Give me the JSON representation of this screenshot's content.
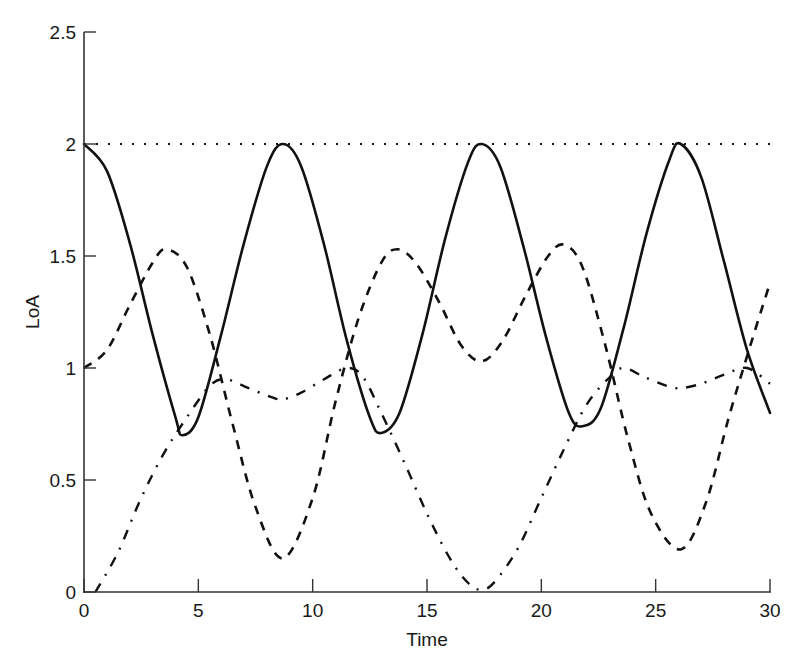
{
  "chart_data": {
    "type": "line",
    "title": "",
    "xlabel": "Time",
    "ylabel": "LoA",
    "xlim": [
      0,
      30
    ],
    "ylim": [
      0,
      2.5
    ],
    "xticks": [
      0,
      5,
      10,
      15,
      20,
      25,
      30
    ],
    "xtick_labels": [
      "0",
      "5",
      "10",
      "15",
      "20",
      "25",
      "30"
    ],
    "yticks": [
      0,
      0.5,
      1,
      1.5,
      2,
      2.5
    ],
    "ytick_labels": [
      "0",
      "0.5",
      "1",
      "1.5",
      "2",
      "2.5"
    ],
    "grid": false,
    "legend": null,
    "series": [
      {
        "name": "solid",
        "style": "solid",
        "color": "#111111",
        "x": [
          0,
          1,
          2,
          3,
          4,
          4.3,
          5,
          6,
          7,
          8,
          8.7,
          9.5,
          10.5,
          11.5,
          12.5,
          13.0,
          13.8,
          14.8,
          15.8,
          16.8,
          17.4,
          18.2,
          19.2,
          20.2,
          21.2,
          21.8,
          22.6,
          23.6,
          24.6,
          25.6,
          26.1,
          27,
          28,
          29,
          30
        ],
        "y": [
          2.0,
          1.88,
          1.56,
          1.15,
          0.78,
          0.7,
          0.78,
          1.15,
          1.56,
          1.9,
          2.0,
          1.9,
          1.55,
          1.12,
          0.78,
          0.71,
          0.8,
          1.15,
          1.58,
          1.92,
          2.0,
          1.9,
          1.55,
          1.14,
          0.8,
          0.74,
          0.82,
          1.18,
          1.6,
          1.93,
          2.0,
          1.85,
          1.47,
          1.08,
          0.8
        ]
      },
      {
        "name": "dashed",
        "style": "dashed",
        "color": "#111111",
        "x": [
          0,
          1,
          2,
          3,
          3.6,
          4.5,
          5.5,
          6.5,
          7.5,
          8.7,
          10,
          11,
          12,
          13,
          13.7,
          14.5,
          15.5,
          16.5,
          17.4,
          18.3,
          19.3,
          20.3,
          21.0,
          21.8,
          22.8,
          23.8,
          24.8,
          26.1,
          27.2,
          28.2,
          29.2,
          30
        ],
        "y": [
          1.0,
          1.08,
          1.28,
          1.47,
          1.53,
          1.45,
          1.15,
          0.75,
          0.38,
          0.15,
          0.42,
          0.85,
          1.22,
          1.47,
          1.53,
          1.47,
          1.3,
          1.1,
          1.03,
          1.12,
          1.32,
          1.5,
          1.55,
          1.45,
          1.1,
          0.68,
          0.35,
          0.19,
          0.4,
          0.78,
          1.12,
          1.38
        ]
      },
      {
        "name": "dash-dot",
        "style": "dashdot",
        "color": "#111111",
        "x": [
          0.5,
          1.5,
          2.5,
          3.5,
          4.5,
          5.5,
          6.2,
          7.2,
          8.2,
          8.7,
          9.5,
          10.5,
          11.5,
          12.2,
          13,
          14,
          15,
          16,
          16.8,
          17.4,
          18,
          19,
          20,
          21,
          22,
          23,
          23.6,
          24.5,
          25.5,
          26.1,
          27,
          28,
          29,
          30
        ],
        "y": [
          0.0,
          0.18,
          0.42,
          0.62,
          0.78,
          0.92,
          0.95,
          0.91,
          0.87,
          0.86,
          0.89,
          0.95,
          1.0,
          0.96,
          0.8,
          0.58,
          0.35,
          0.15,
          0.04,
          0.01,
          0.05,
          0.2,
          0.42,
          0.64,
          0.84,
          0.96,
          1.0,
          0.96,
          0.92,
          0.91,
          0.93,
          0.97,
          1.0,
          0.93
        ]
      },
      {
        "name": "dotted",
        "style": "dotted",
        "color": "#111111",
        "x": [
          0,
          30
        ],
        "y": [
          2.0,
          2.0
        ]
      }
    ]
  },
  "axes": {
    "xlabel": "Time",
    "ylabel": "LoA"
  }
}
